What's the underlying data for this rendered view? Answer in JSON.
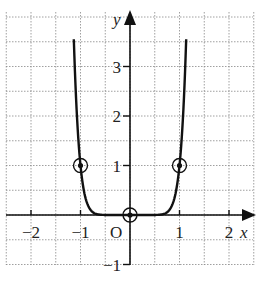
{
  "chart_data": {
    "type": "line",
    "title": "",
    "function": "y = x^10 (steep even-power curve)",
    "xlabel": "x",
    "ylabel": "y",
    "origin_label": "O",
    "xlim": [
      -2.5,
      2.5
    ],
    "ylim": [
      -1,
      3.5
    ],
    "grid": true,
    "grid_step": 0.5,
    "x_ticks": [
      -2,
      -1,
      1,
      2
    ],
    "x_tick_labels": [
      "−2",
      "−1",
      "1",
      "2"
    ],
    "y_ticks": [
      -1,
      1,
      2,
      3
    ],
    "y_tick_labels": [
      "−1",
      "1",
      "2",
      "3"
    ],
    "marked_points": [
      {
        "x": -1,
        "y": 1
      },
      {
        "x": 0,
        "y": 0
      },
      {
        "x": 1,
        "y": 1
      }
    ],
    "colors": {
      "curve": "#111111",
      "grid": "#888888",
      "axis": "#111111"
    }
  }
}
